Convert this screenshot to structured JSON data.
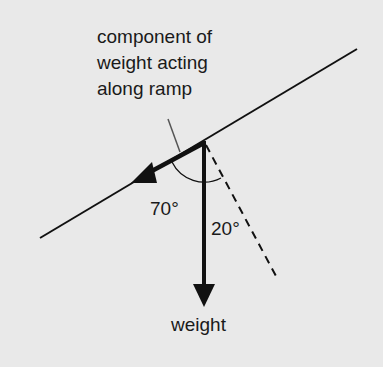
{
  "diagram": {
    "caption_lines": [
      "component of",
      "weight acting",
      "along ramp"
    ],
    "angle_large_label": "70°",
    "angle_small_label": "20°",
    "weight_label": "weight",
    "colors": {
      "background": "#e9e9e9",
      "ink": "#111111",
      "leader": "#555555"
    }
  }
}
